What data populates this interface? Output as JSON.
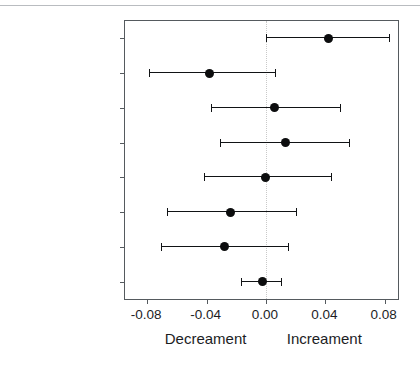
{
  "chart_data": {
    "type": "scatter",
    "title": "",
    "subtitle": "",
    "xlabel": "",
    "ylabel": "",
    "xlim": [
      -0.095,
      0.089
    ],
    "ylim": [
      0,
      8
    ],
    "grid": false,
    "legend": null,
    "orientation": "horizontal",
    "plot_style": "forest-plot",
    "reference_line": {
      "value": 0.0,
      "style": "dotted",
      "color": "#c9c9c9"
    },
    "marker_color": "#0c0d0e",
    "line_color": "#111315",
    "frame_color": "#555a5e",
    "xticks": [
      -0.08,
      -0.04,
      0.0,
      0.04,
      0.08
    ],
    "xticklabels": [
      "-0.08",
      "-0.04",
      "0.00",
      "0.04",
      "0.08"
    ],
    "axis_captions": [
      {
        "text": "Decreament",
        "at": -0.04
      },
      {
        "text": "Increament",
        "at": 0.04
      }
    ],
    "categories": [
      "Dorsal",
      "Caudal",
      "Anal",
      "Left pelvic",
      "Right pelvic",
      "Left pectoral",
      "Right pectoral",
      "Total"
    ],
    "points": [
      {
        "label": "Dorsal",
        "value": 0.042,
        "ci_low": 0.0,
        "ci_high": 0.083
      },
      {
        "label": "Caudal",
        "value": -0.038,
        "ci_low": -0.079,
        "ci_high": 0.006
      },
      {
        "label": "Anal",
        "value": 0.006,
        "ci_low": -0.037,
        "ci_high": 0.05
      },
      {
        "label": "Left pelvic",
        "value": 0.013,
        "ci_low": -0.031,
        "ci_high": 0.056
      },
      {
        "label": "Right pelvic",
        "value": 0.0,
        "ci_low": -0.042,
        "ci_high": 0.044
      },
      {
        "label": "Left pectoral",
        "value": -0.024,
        "ci_low": -0.067,
        "ci_high": 0.02
      },
      {
        "label": "Right pectoral",
        "value": -0.028,
        "ci_low": -0.071,
        "ci_high": 0.015
      },
      {
        "label": "Total",
        "value": -0.002,
        "ci_low": -0.017,
        "ci_high": 0.01
      }
    ]
  }
}
